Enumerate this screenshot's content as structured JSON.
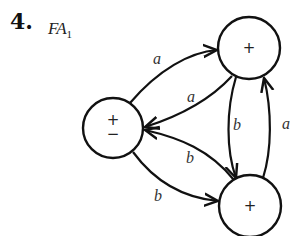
{
  "problem": {
    "number": "4.",
    "machine_name": "FA",
    "machine_subscript": "1"
  },
  "diagram": {
    "type": "finite-automaton",
    "states": [
      {
        "id": "s_left",
        "label_top": "+",
        "label_bottom": "−",
        "start": true,
        "final": false
      },
      {
        "id": "s_top",
        "label": "+",
        "final": true
      },
      {
        "id": "s_bottom",
        "label": "+",
        "final": true
      }
    ],
    "transitions": [
      {
        "from": "s_left",
        "to": "s_top",
        "symbol": "a"
      },
      {
        "from": "s_top",
        "to": "s_left",
        "symbol": "a"
      },
      {
        "from": "s_top",
        "to": "s_bottom",
        "symbol": "b"
      },
      {
        "from": "s_bottom",
        "to": "s_top",
        "symbol": "a"
      },
      {
        "from": "s_bottom",
        "to": "s_left",
        "symbol": "b"
      },
      {
        "from": "s_left",
        "to": "s_bottom",
        "symbol": "b"
      }
    ],
    "edge_labels": {
      "left_to_top": "a",
      "top_to_left": "a",
      "top_to_bottom": "b",
      "bottom_to_top": "a",
      "bottom_to_left": "b",
      "left_to_bottom": "b"
    },
    "node_labels": {
      "left_plus": "+",
      "left_minus": "−",
      "top": "+",
      "bottom": "+"
    }
  }
}
